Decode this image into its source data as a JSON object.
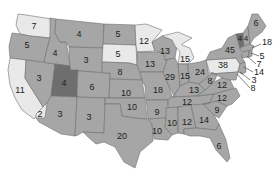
{
  "title": "",
  "colors": {
    "default": "#a6a6a6",
    "light": "#e9e9e9",
    "dark": "#6e6e6e",
    "medium_dark": "#8c8c8c",
    "border": "#6f6f6f",
    "water": "#ffffff",
    "label": "#222222"
  },
  "states": {
    "WA": {
      "value": "7",
      "fill": "light"
    },
    "OR": {
      "value": "5",
      "fill": "default"
    },
    "CA": {
      "value": "11",
      "fill": "light"
    },
    "NV": {
      "value": "3",
      "fill": "default"
    },
    "ID": {
      "value": "4",
      "fill": "default"
    },
    "MT": {
      "value": "4",
      "fill": "default"
    },
    "WY": {
      "value": "3",
      "fill": "default"
    },
    "UT": {
      "value": "4",
      "fill": "dark"
    },
    "AZ": {
      "value": "3",
      "fill": "default"
    },
    "AZ_SW": {
      "value": "2",
      "fill": "light"
    },
    "CO": {
      "value": "6",
      "fill": "default"
    },
    "NM": {
      "value": "3",
      "fill": "default"
    },
    "ND": {
      "value": "5",
      "fill": "default"
    },
    "SD": {
      "value": "5",
      "fill": "light"
    },
    "NE": {
      "value": "8",
      "fill": "default"
    },
    "KS": {
      "value": "10",
      "fill": "default"
    },
    "OK": {
      "value": "10",
      "fill": "default"
    },
    "TX": {
      "value": "20",
      "fill": "default"
    },
    "MN": {
      "value": "12",
      "fill": "light"
    },
    "IA": {
      "value": "13",
      "fill": "default"
    },
    "MO": {
      "value": "18",
      "fill": "default"
    },
    "AR": {
      "value": "9",
      "fill": "default"
    },
    "LA": {
      "value": "10",
      "fill": "default"
    },
    "WI": {
      "value": "13",
      "fill": "default"
    },
    "IL": {
      "value": "29",
      "fill": "default"
    },
    "MI": {
      "value": "15",
      "fill": "light"
    },
    "IN": {
      "value": "15",
      "fill": "default"
    },
    "OH": {
      "value": "24",
      "fill": "default"
    },
    "KY": {
      "value": "13",
      "fill": "default"
    },
    "TN": {
      "value": "12",
      "fill": "default"
    },
    "MS": {
      "value": "10",
      "fill": "default"
    },
    "AL": {
      "value": "12",
      "fill": "default"
    },
    "GA": {
      "value": "14",
      "fill": "default"
    },
    "FL": {
      "value": "6",
      "fill": "default"
    },
    "SC": {
      "value": "9",
      "fill": "default"
    },
    "NC": {
      "value": "12",
      "fill": "default"
    },
    "VA": {
      "value": "12",
      "fill": "default"
    },
    "WV": {
      "value": "8",
      "fill": "default"
    },
    "PA": {
      "value": "38",
      "fill": "light"
    },
    "NY": {
      "value": "45",
      "fill": "default"
    },
    "VT": {
      "value": "4",
      "fill": "dark"
    },
    "NH": {
      "value": "4",
      "fill": "default"
    },
    "ME": {
      "value": "6",
      "fill": "default"
    },
    "MA": {
      "value": "18",
      "fill": "default"
    },
    "RI": {
      "value": "5",
      "fill": "default"
    },
    "CT": {
      "value": "7",
      "fill": "default"
    },
    "NJ": {
      "value": "14",
      "fill": "default"
    },
    "DE": {
      "value": "3",
      "fill": "default"
    },
    "MD": {
      "value": "8",
      "fill": "default"
    }
  }
}
